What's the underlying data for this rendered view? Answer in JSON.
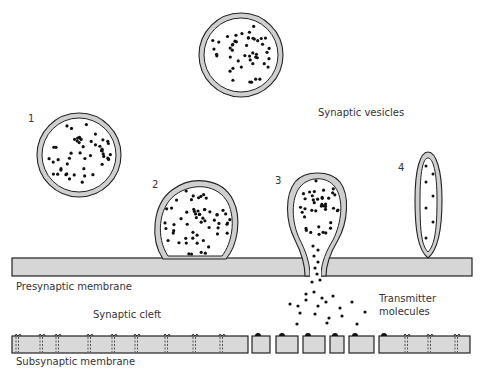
{
  "labels": {
    "synaptic_vesicles": "Synaptic vesicles",
    "presynaptic_membrane": "Presynaptic membrane",
    "synaptic_cleft": "Synaptic cleft",
    "transmitter_line1": "Transmitter",
    "transmitter_line2": "molecules",
    "subsynaptic_membrane": "Subsynaptic membrane"
  },
  "stages": [
    {
      "number": "1",
      "description": "free vesicle"
    },
    {
      "number": "2",
      "description": "vesicle docked at membrane"
    },
    {
      "number": "3",
      "description": "vesicle releasing contents (exocytosis)"
    },
    {
      "number": "4",
      "description": "collapsed empty vesicle"
    }
  ],
  "colors": {
    "ink": "#222222",
    "membrane_fill": "#d6d6d6",
    "vesicle_wall": "#cfcfcf",
    "background": "#ffffff"
  }
}
